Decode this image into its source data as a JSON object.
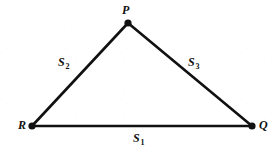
{
  "figure": {
    "type": "geometry-diagram",
    "shape": "triangle",
    "width": 278,
    "height": 153,
    "background_color": "#ffffff",
    "stroke_color": "#111111",
    "stroke_width": 2.6,
    "vertex_dot_radius": 3.6,
    "vertices": [
      {
        "id": "P",
        "label": "P",
        "x": 128,
        "y": 23,
        "label_x": 122,
        "label_y": 4
      },
      {
        "id": "R",
        "label": "R",
        "x": 32,
        "y": 126,
        "label_x": 18,
        "label_y": 119
      },
      {
        "id": "Q",
        "label": "Q",
        "x": 252,
        "y": 126,
        "label_x": 259,
        "label_y": 119
      }
    ],
    "edges": [
      {
        "id": "S1",
        "from": "R",
        "to": "Q",
        "label_main": "S",
        "label_sub": "1",
        "label_x": 133,
        "label_y": 132
      },
      {
        "id": "S2",
        "from": "R",
        "to": "P",
        "label_main": "S",
        "label_sub": "2",
        "label_x": 58,
        "label_y": 56
      },
      {
        "id": "S3",
        "from": "P",
        "to": "Q",
        "label_main": "S",
        "label_sub": "3",
        "label_x": 188,
        "label_y": 56
      }
    ]
  }
}
